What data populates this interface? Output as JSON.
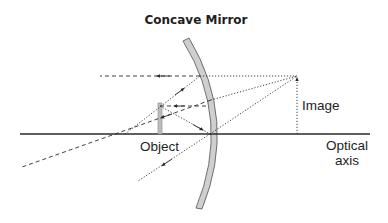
{
  "title": "Concave Mirror",
  "labels": {
    "object": "Object",
    "image": "Image",
    "axis_line1": "Optical",
    "axis_line2": "axis"
  },
  "colors": {
    "ink": "#2a2a2a",
    "mirror_fill": "#c8c8c8",
    "mirror_edge": "#6e6e6e",
    "object_fill": "#b9b9b9",
    "background": "#ffffff"
  },
  "elements": {
    "optical_axis": {
      "x1": 20,
      "x2": 370,
      "y": 134
    },
    "mirror": {
      "top": [
        186,
        39
      ],
      "vertex": [
        211,
        134
      ],
      "bottom": [
        199,
        208
      ]
    },
    "object": {
      "x": 160,
      "top": 104,
      "base": 134
    },
    "image": {
      "x": 297,
      "top": 76,
      "base": 134
    },
    "focal_point": [
      125,
      134
    ]
  },
  "rays": [
    {
      "id": "parallel-out",
      "style": "dashed",
      "from": [
        200,
        76
      ],
      "to": [
        100,
        76
      ],
      "arrow": "left"
    },
    {
      "id": "through-focus-in",
      "style": "dotted",
      "from": [
        125,
        134
      ],
      "to": [
        200,
        76
      ],
      "arrow": "up-right"
    },
    {
      "id": "parallel-in",
      "style": "dashed",
      "from": [
        160,
        106
      ],
      "to": [
        209,
        106
      ],
      "arrow": "left"
    },
    {
      "id": "focus-out",
      "style": "dashed",
      "from": [
        211,
        100
      ],
      "to": [
        22,
        167
      ],
      "arrow": "down-left"
    },
    {
      "id": "vertex-in",
      "style": "dotted",
      "from": [
        160,
        106
      ],
      "to": [
        210,
        134
      ],
      "arrow": "down-right"
    },
    {
      "id": "vertex-out",
      "style": "dotted",
      "from": [
        210,
        134
      ],
      "to": [
        138,
        181
      ],
      "arrow": "down-left"
    },
    {
      "id": "virtual-1",
      "style": "dotted",
      "from": [
        200,
        76
      ],
      "to": [
        297,
        76
      ]
    },
    {
      "id": "virtual-2",
      "style": "dotted",
      "from": [
        211,
        100
      ],
      "to": [
        297,
        76
      ]
    },
    {
      "id": "virtual-3",
      "style": "dotted",
      "from": [
        210,
        134
      ],
      "to": [
        297,
        76
      ]
    }
  ]
}
